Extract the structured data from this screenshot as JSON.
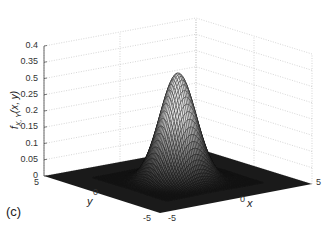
{
  "chart_data": {
    "type": "surface",
    "title": "",
    "panel_label": "(c)",
    "xlabel": "x",
    "ylabel": "y",
    "zlabel": "f_{X,Y}(x, y)",
    "xlim": [
      -5,
      5
    ],
    "ylim": [
      -5,
      5
    ],
    "zlim": [
      0,
      0.4
    ],
    "x_ticks": [
      "-5",
      "0",
      "5"
    ],
    "y_ticks": [
      "-5",
      "0",
      "5"
    ],
    "z_ticks": [
      "0",
      "0.05",
      "0.1",
      "0.15",
      "0.2",
      "0.25",
      "0.5",
      "0.35",
      "0.4"
    ],
    "grid": true,
    "surface": "bivariate Gaussian density, peak ~0.33 at (0,0)",
    "peak_value": 0.33
  },
  "labels": {
    "panel": "(c)",
    "x_axis": "x",
    "y_axis": "y",
    "z_axis": "f",
    "z_axis_sub": "X, Y",
    "z_axis_args": "(x, y)"
  }
}
